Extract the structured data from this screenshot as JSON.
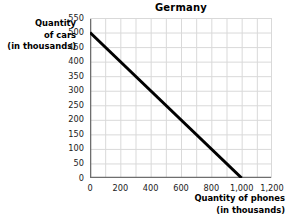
{
  "chart_data": {
    "type": "line",
    "title": "Germany",
    "xlabel": "Quantity of phones",
    "xlabel_line2": "(in thousands)",
    "ylabel": "Quantity",
    "ylabel_line2": "of cars",
    "ylabel_line3": "(in thousands)",
    "xlim": [
      0,
      1200
    ],
    "ylim": [
      0,
      550
    ],
    "grid": true,
    "grid_color": "#d9d9d9",
    "legend": "none",
    "line_color": "#000000",
    "xticks": [
      0,
      200,
      400,
      600,
      800,
      1000,
      1200
    ],
    "xtick_labels": [
      "0",
      "200",
      "400",
      "600",
      "800",
      "1,000",
      "1,200"
    ],
    "yticks": [
      0,
      50,
      100,
      150,
      200,
      250,
      300,
      350,
      400,
      450,
      500,
      550
    ],
    "ytick_labels": [
      "0",
      "50",
      "100",
      "150",
      "200",
      "250",
      "300",
      "350",
      "400",
      "450",
      "500",
      "550"
    ],
    "x_minor_step": 100,
    "y_minor_step": 50,
    "series": [
      {
        "name": "production-possibilities-frontier",
        "points": [
          {
            "x": 0,
            "y": 500
          },
          {
            "x": 1000,
            "y": 0
          }
        ],
        "color": "#000000",
        "width": 3
      }
    ]
  }
}
